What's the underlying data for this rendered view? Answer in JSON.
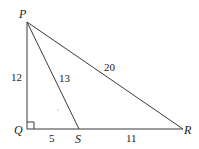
{
  "diagram": {
    "type": "right-triangle",
    "colors": {
      "line": "#3a3a3a",
      "text": "#222222",
      "background": "#ffffff"
    },
    "points": {
      "P": {
        "label": "P",
        "x": 27,
        "y": 22
      },
      "Q": {
        "label": "Q",
        "x": 27,
        "y": 129
      },
      "S": {
        "label": "S",
        "x": 79,
        "y": 129
      },
      "R": {
        "label": "R",
        "x": 183,
        "y": 129
      }
    },
    "segments": {
      "PQ": {
        "label": "12"
      },
      "PS": {
        "label": "13"
      },
      "PR": {
        "label": "20"
      },
      "QS": {
        "label": "5"
      },
      "SR": {
        "label": "11"
      }
    },
    "right_angle_at": "Q"
  }
}
